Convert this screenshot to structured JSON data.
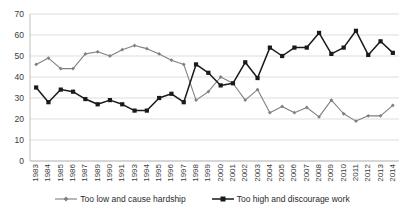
{
  "chart_data": {
    "type": "line",
    "title": "",
    "subtitle": "",
    "xlabel": "",
    "ylabel": "",
    "ylim": [
      0,
      70
    ],
    "ytick_step": 10,
    "yticks": [
      0,
      10,
      20,
      30,
      40,
      50,
      60,
      70
    ],
    "grid": "horizontal",
    "legend_position": "bottom",
    "categories": [
      "1983",
      "1984",
      "1985",
      "1986",
      "1987",
      "1989",
      "1990",
      "1991",
      "1993",
      "1994",
      "1995",
      "1996",
      "1997",
      "1998",
      "1999",
      "2000",
      "2001",
      "2002",
      "2003",
      "2004",
      "2005",
      "2006",
      "2007",
      "2008",
      "2009",
      "2010",
      "2011",
      "2012",
      "2013",
      "2014"
    ],
    "series": [
      {
        "name": "Too low and cause hardship",
        "color": "#808080",
        "marker": "diamond",
        "values": [
          46,
          49,
          44,
          44,
          51,
          52,
          50,
          53,
          55,
          53.5,
          51,
          48,
          46,
          29,
          33,
          40,
          37,
          29,
          34,
          23,
          26,
          23,
          25.5,
          21,
          29,
          22.5,
          19,
          21.5,
          21.5,
          26.5
        ]
      },
      {
        "name": "Too high and discourage work",
        "color": "#1a1a1a",
        "marker": "square",
        "values": [
          35,
          28,
          34,
          33,
          29.5,
          27,
          29,
          27,
          24,
          24,
          30,
          32,
          28,
          46,
          42,
          36,
          37,
          47,
          39.5,
          54,
          50,
          54,
          54,
          61,
          51,
          54,
          62,
          50.5,
          57,
          51.5
        ]
      }
    ]
  },
  "legend": {
    "items": [
      {
        "label": "Too low and cause hardship",
        "color": "#808080",
        "marker": "diamond"
      },
      {
        "label": "Too high and discourage work",
        "color": "#1a1a1a",
        "marker": "square"
      }
    ]
  }
}
